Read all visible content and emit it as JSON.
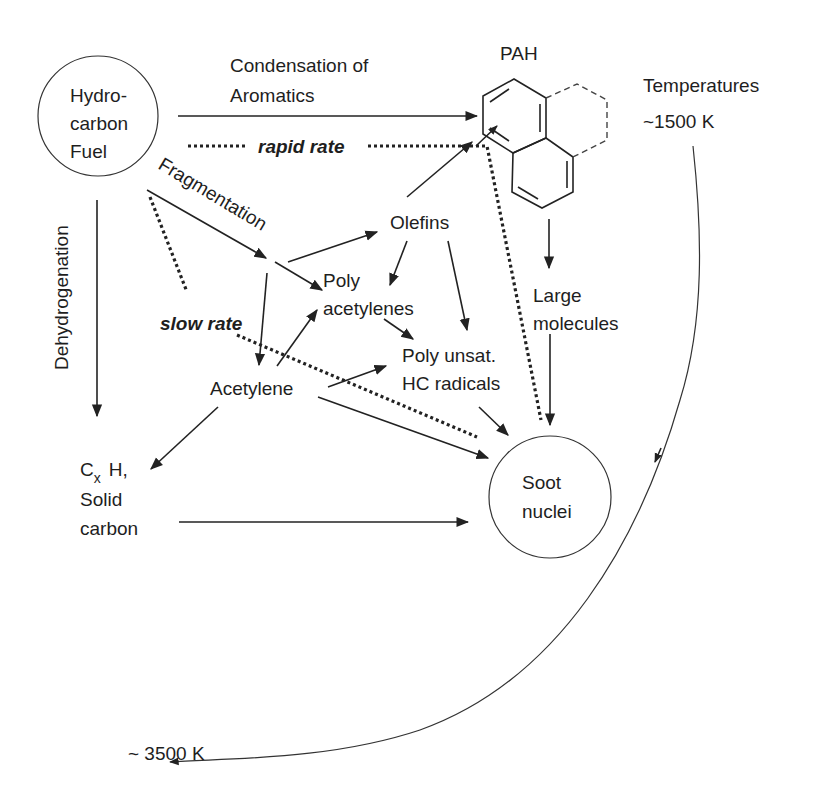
{
  "diagram": {
    "nodes": {
      "fuel": {
        "lines": [
          "Hydro-",
          "carbon",
          "Fuel"
        ],
        "shape": "circle"
      },
      "condensation": {
        "lines": [
          "Condensation of",
          "Aromatics"
        ]
      },
      "pah": {
        "label": "PAH"
      },
      "temperatures": {
        "label": "Temperatures",
        "low": "~1500 K",
        "high": "~ 3500 K"
      },
      "fragmentation": {
        "label": "Fragmentation"
      },
      "rapid_rate": {
        "label": "rapid rate"
      },
      "slow_rate": {
        "label": "slow rate"
      },
      "dehydrogenation": {
        "label": "Dehydrogenation"
      },
      "olefins": {
        "label": "Olefins"
      },
      "polyacetylenes": {
        "lines": [
          "Poly",
          "acetylenes"
        ]
      },
      "acetylene": {
        "label": "Acetylene"
      },
      "poly_unsat": {
        "lines": [
          "Poly unsat.",
          "HC radicals"
        ]
      },
      "large_molecules": {
        "lines": [
          "Large",
          "molecules"
        ]
      },
      "solid_carbon": {
        "c": "C",
        "sub": "x",
        "h": "H,",
        "lines": [
          "Solid",
          "carbon"
        ]
      },
      "soot": {
        "lines": [
          "Soot",
          "nuclei"
        ],
        "shape": "circle"
      }
    },
    "edges": [
      {
        "from": "Hydrocarbon Fuel",
        "to": "PAH",
        "label": "Condensation of Aromatics",
        "style": "solid"
      },
      {
        "from": "Hydrocarbon Fuel",
        "to": "PAH",
        "label": "rapid rate",
        "style": "dotted"
      },
      {
        "from": "PAH",
        "to": "Soot nuclei",
        "label": "rapid rate",
        "style": "dotted"
      },
      {
        "from": "Hydrocarbon Fuel",
        "to": "Fragmentation point",
        "label": "Fragmentation",
        "style": "solid"
      },
      {
        "from": "Hydrocarbon Fuel",
        "to": "Soot nuclei",
        "label": "slow rate",
        "style": "dotted"
      },
      {
        "from": "Hydrocarbon Fuel",
        "to": "Cx H, Solid carbon",
        "label": "Dehydrogenation",
        "style": "solid"
      },
      {
        "from": "Fragmentation point",
        "to": "Olefins",
        "style": "solid"
      },
      {
        "from": "Fragmentation point",
        "to": "Poly acetylenes",
        "style": "solid"
      },
      {
        "from": "Fragmentation point",
        "to": "Acetylene",
        "style": "solid"
      },
      {
        "from": "Olefins",
        "to": "PAH",
        "style": "solid"
      },
      {
        "from": "Olefins",
        "to": "Poly acetylenes",
        "style": "solid"
      },
      {
        "from": "Olefins",
        "to": "Poly unsat. HC radicals",
        "style": "solid"
      },
      {
        "from": "Poly acetylenes",
        "to": "Poly unsat. HC radicals",
        "style": "solid"
      },
      {
        "from": "Acetylene",
        "to": "Poly acetylenes",
        "style": "solid"
      },
      {
        "from": "Acetylene",
        "to": "Poly unsat. HC radicals",
        "style": "solid"
      },
      {
        "from": "Acetylene",
        "to": "Soot nuclei",
        "style": "solid"
      },
      {
        "from": "Acetylene",
        "to": "Cx H, Solid carbon",
        "style": "solid"
      },
      {
        "from": "Poly unsat. HC radicals",
        "to": "Soot nuclei",
        "style": "solid"
      },
      {
        "from": "PAH",
        "to": "Large molecules",
        "style": "solid"
      },
      {
        "from": "Large molecules",
        "to": "Soot nuclei",
        "style": "solid"
      },
      {
        "from": "Cx H, Solid carbon",
        "to": "Soot nuclei",
        "style": "solid"
      },
      {
        "from": "~1500 K",
        "to": "~ 3500 K",
        "style": "curved"
      }
    ],
    "colors": {
      "line": "#222222",
      "text": "#1e1e1e",
      "background": "#ffffff"
    }
  }
}
